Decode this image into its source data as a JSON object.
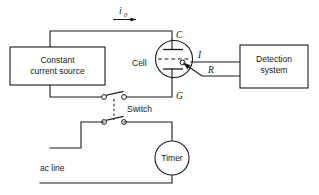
{
  "diagram": {
    "line_color": "#1a1a1a",
    "background_color": "#ffffff"
  },
  "blocks": {
    "constant_current_source": {
      "label_line1": "Constant",
      "label_line2": "current source"
    },
    "detection_system": {
      "label_line1": "Detection",
      "label_line2": "system"
    },
    "timer": {
      "label": "Timer"
    },
    "cell": {
      "label": "Cell",
      "terminal_top": "C",
      "terminal_bottom": "G",
      "electrode_indicator": "I",
      "reference_lead": "R"
    }
  },
  "labels": {
    "current_symbol": "i",
    "current_subscript": "0",
    "switch": "Switch",
    "ac_line": "ac line"
  }
}
